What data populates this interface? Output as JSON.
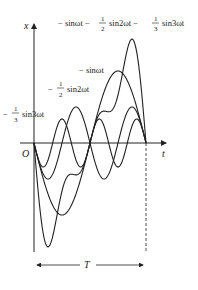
{
  "axes": {
    "x_label": "t",
    "y_label": "x",
    "origin_label": "O",
    "period_label": "T"
  },
  "curve_labels": {
    "sum": {
      "prefix": "− sinωt −",
      "frac1_num": "1",
      "frac1_den": "2",
      "mid": "sin2ωt −",
      "frac2_num": "1",
      "frac2_den": "3",
      "suffix": "sin3ωt"
    },
    "sin1": {
      "text": "− sinωt"
    },
    "sin2": {
      "prefix": "−",
      "frac_num": "1",
      "frac_den": "2",
      "suffix": "sin2ωt"
    },
    "sin3": {
      "prefix": "−",
      "frac_num": "1",
      "frac_den": "3",
      "suffix": "sin3ωt"
    }
  },
  "colors": {
    "stroke": "#222222",
    "background": "#ffffff"
  }
}
